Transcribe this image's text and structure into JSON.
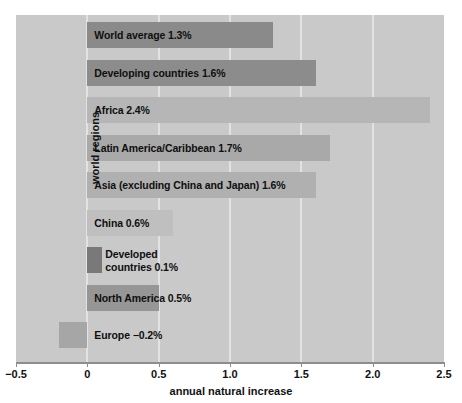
{
  "chart_data": {
    "type": "bar",
    "orientation": "horizontal",
    "title": "",
    "xlabel": "annual natural increase",
    "ylabel": "world regions",
    "xlim": [
      -0.5,
      2.5
    ],
    "xticks": [
      "−0.5",
      "0",
      "0.5",
      "1.0",
      "1.5",
      "2.0",
      "2.5"
    ],
    "xtick_values": [
      -0.5,
      0,
      0.5,
      1.0,
      1.5,
      2.0,
      2.5
    ],
    "grid": "vertical",
    "legend": "none",
    "categories": [
      "World average",
      "Developing countries",
      "Africa",
      "Latin America/Caribbean",
      "Asia (excluding China and Japan)",
      "China",
      "Developed countries",
      "North America",
      "Europe"
    ],
    "values": [
      1.3,
      1.6,
      2.4,
      1.7,
      1.6,
      0.6,
      0.1,
      0.5,
      -0.2
    ],
    "bars": [
      {
        "label": "World average 1.3%",
        "category": "World average",
        "value": 1.3,
        "color": "#8a8a8a",
        "label_lines": [
          "World average 1.3%"
        ]
      },
      {
        "label": "Developing countries 1.6%",
        "category": "Developing countries",
        "value": 1.6,
        "color": "#8c8c8c",
        "label_lines": [
          "Developing countries 1.6%"
        ]
      },
      {
        "label": "Africa 2.4%",
        "category": "Africa",
        "value": 2.4,
        "color": "#b6b6b6",
        "label_lines": [
          "Africa 2.4%"
        ]
      },
      {
        "label": "Latin America/Caribbean 1.7%",
        "category": "Latin America/Caribbean",
        "value": 1.7,
        "color": "#a9a9a9",
        "label_lines": [
          "Latin America/Caribbean 1.7%"
        ]
      },
      {
        "label": "Asia (excluding China and Japan) 1.6%",
        "category": "Asia (excluding China and Japan)",
        "value": 1.6,
        "color": "#b0b0b0",
        "label_lines": [
          "Asia (excluding China and Japan) 1.6%"
        ]
      },
      {
        "label": "China 0.6%",
        "category": "China",
        "value": 0.6,
        "color": "#bfbfbf",
        "label_lines": [
          "China 0.6%"
        ]
      },
      {
        "label": "Developed countries 0.1%",
        "category": "Developed countries",
        "value": 0.1,
        "color": "#797979",
        "label_lines": [
          "Developed",
          "countries 0.1%"
        ]
      },
      {
        "label": "North America 0.5%",
        "category": "North America",
        "value": 0.5,
        "color": "#969696",
        "label_lines": [
          "North America 0.5%"
        ]
      },
      {
        "label": "Europe −0.2%",
        "category": "Europe",
        "value": -0.2,
        "color": "#a6a6a6",
        "label_lines": [
          "Europe  −0.2%"
        ]
      }
    ],
    "colors": {
      "plot_background": "#c9c9c9",
      "page_background": "#ffffff",
      "gridline": "#e2e2e2",
      "axis": "#8d8d8d",
      "text": "#111111"
    }
  },
  "axis": {
    "x_title": "annual natural increase",
    "y_title": "world regions",
    "ticks": [
      {
        "label": "−0.5",
        "value": -0.5
      },
      {
        "label": "0",
        "value": 0
      },
      {
        "label": "0.5",
        "value": 0.5
      },
      {
        "label": "1.0",
        "value": 1.0
      },
      {
        "label": "1.5",
        "value": 1.5
      },
      {
        "label": "2.0",
        "value": 2.0
      },
      {
        "label": "2.5",
        "value": 2.5
      }
    ]
  }
}
